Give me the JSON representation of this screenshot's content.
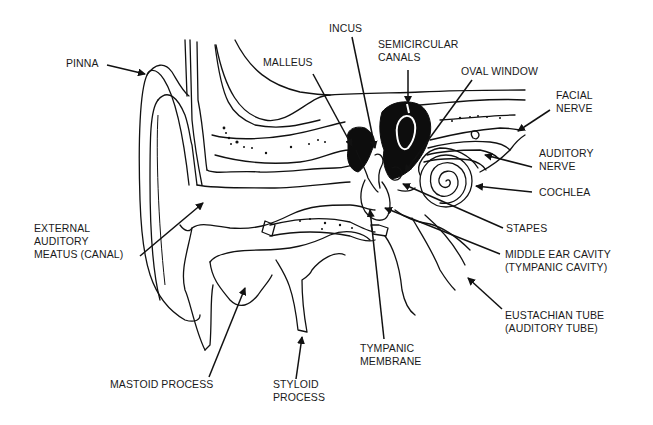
{
  "diagram": {
    "labels": {
      "pinna": "PINNA",
      "malleus": "MALLEUS",
      "incus": "INCUS",
      "semicircular_canals": "SEMICIRCULAR\nCANALS",
      "oval_window": "OVAL WINDOW",
      "facial_nerve": "FACIAL\nNERVE",
      "auditory_nerve": "AUDITORY\nNERVE",
      "cochlea": "COCHLEA",
      "stapes": "STAPES",
      "middle_ear_cavity": "MIDDLE EAR CAVITY\n(TYMPANIC CAVITY)",
      "eustachian_tube": "EUSTACHIAN TUBE\n(AUDITORY TUBE)",
      "external_auditory_meatus": "EXTERNAL\nAUDITORY\nMEATUS (CANAL)",
      "tympanic_membrane": "TYMPANIC\nMEMBRANE",
      "mastoid_process": "MASTOID PROCESS",
      "styloid_process": "STYLOID\nPROCESS"
    },
    "colors": {
      "line": "#111111",
      "background": "#ffffff",
      "text": "#1a1a1a"
    }
  }
}
